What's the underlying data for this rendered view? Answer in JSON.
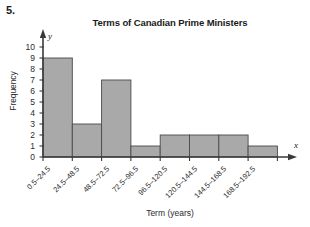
{
  "problem_number": "5.",
  "chart_data": {
    "type": "bar",
    "title": "Terms of Canadian Prime Ministers",
    "xlabel": "Term (years)",
    "ylabel": "Frequency",
    "categories": [
      "0.5–24.5",
      "24.5–48.5",
      "48.5–72.5",
      "72.5–96.5",
      "96.5–120.5",
      "120.5–144.5",
      "144.5–168.5",
      "168.5–192.5"
    ],
    "values": [
      9,
      3,
      7,
      1,
      2,
      2,
      2,
      1
    ],
    "ylim": [
      0,
      10
    ],
    "y_ticks": [
      "0",
      "1",
      "2",
      "3",
      "4",
      "5",
      "6",
      "7",
      "8",
      "9",
      "10"
    ],
    "grid": false,
    "legend": false,
    "x_axis_letter": "x",
    "y_axis_letter": "y",
    "bar_fill_color": "#a9a9a9",
    "bar_border_color": "#4a4a4a",
    "axis_color": "#3a3a3a"
  }
}
